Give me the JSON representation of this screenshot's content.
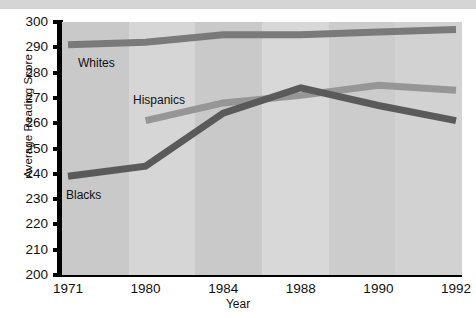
{
  "chart_data": {
    "type": "line",
    "title": "",
    "xlabel": "Year",
    "ylabel": "Average Reading Score",
    "categories": [
      "1971",
      "1980",
      "1984",
      "1988",
      "1990",
      "1992"
    ],
    "ylim": [
      200,
      300
    ],
    "xlim_categorical": true,
    "grid": false,
    "legend_position": "inline-labels",
    "y_ticks": [
      200,
      210,
      220,
      230,
      240,
      250,
      260,
      270,
      280,
      290,
      300
    ],
    "series": [
      {
        "name": "Whites",
        "color": "#7a7a7a",
        "x": [
          "1971",
          "1980",
          "1984",
          "1988",
          "1990",
          "1992"
        ],
        "values": [
          291,
          292,
          295,
          295,
          296,
          297
        ],
        "label_text": "Whites"
      },
      {
        "name": "Hispanics",
        "color": "#969696",
        "x": [
          "1980",
          "1984",
          "1988",
          "1990",
          "1992"
        ],
        "values": [
          261,
          268,
          271,
          275,
          273
        ],
        "label_text": "Hispanics"
      },
      {
        "name": "Blacks",
        "color": "#5a5a5a",
        "x": [
          "1971",
          "1980",
          "1984",
          "1988",
          "1990",
          "1992"
        ],
        "values": [
          239,
          243,
          264,
          274,
          267,
          261
        ],
        "label_text": "Blacks"
      }
    ],
    "background_bands": [
      "#c9c9c9",
      "#d6d6d6",
      "#c9c9c9",
      "#d8d8d8",
      "#cccccc",
      "#d2d2d2"
    ]
  },
  "axis": {
    "y_tick_labels": [
      "300",
      "290",
      "280",
      "270",
      "260",
      "250",
      "240",
      "230",
      "220",
      "210",
      "200"
    ],
    "x_tick_labels": [
      "1971",
      "1980",
      "1984",
      "1988",
      "1990",
      "1992"
    ],
    "y_axis_title": "Average Reading Score",
    "x_axis_title": "Year"
  },
  "annotations": {
    "whites_label": "Whites",
    "hispanics_label": "Hispanics",
    "blacks_label": "Blacks"
  },
  "colors": {
    "whites": "#7a7a7a",
    "hispanics": "#969696",
    "blacks": "#5a5a5a",
    "axis": "#000000",
    "text": "#111111",
    "top_band": "#d5d5d5"
  }
}
